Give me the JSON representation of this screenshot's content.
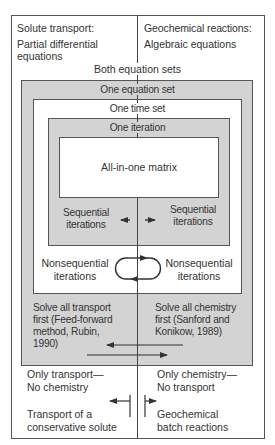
{
  "top": {
    "left_title": "Solute transport:",
    "left_sub_1": "Partial differential",
    "left_sub_2": "equations",
    "right_title": "Geochemical reactions:",
    "right_sub": "Algebraic equations",
    "both_label": "Both equation sets"
  },
  "levels": {
    "equation_set": "One equation set",
    "time_set": "One time set",
    "iteration": "One iteration",
    "matrix": "All-in-one matrix"
  },
  "sequential": {
    "left_1": "Sequential",
    "left_2": "iterations",
    "right_1": "Sequential",
    "right_2": "iterations"
  },
  "nonsequential": {
    "left_1": "Nonsequential",
    "left_2": "iterations",
    "right_1": "Nonsequential",
    "right_2": "iterations"
  },
  "solve": {
    "left_lines": [
      "Solve all transport",
      "first (Feed-forward",
      "method, Rubin,",
      "1990)"
    ],
    "right_lines": [
      "Solve all chemistry",
      "first (Sanford and",
      "Konikow, 1989)"
    ]
  },
  "bottom": {
    "left_1": "Only transport—",
    "left_2": "No chemistry",
    "left_3": "Transport of a",
    "left_4": "conservative solute",
    "right_1": "Only chemistry—",
    "right_2": "No transport",
    "right_3": "Geochemical",
    "right_4": "batch reactions"
  },
  "colors": {
    "shade": "#d3d3d3",
    "line": "#555555",
    "text": "#333333"
  }
}
